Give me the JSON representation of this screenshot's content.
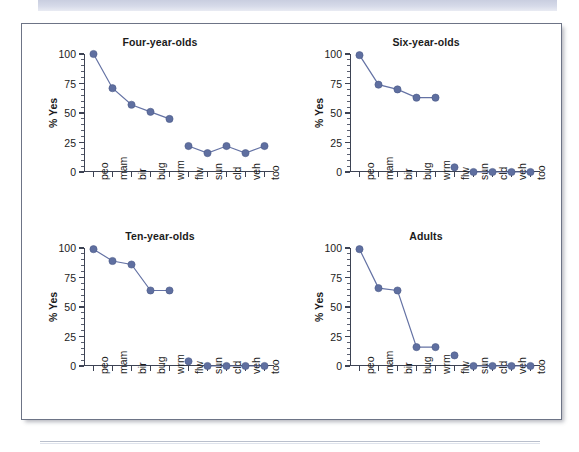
{
  "figure": {
    "panels_per_row": 2,
    "marker_color": "#5f6fa0",
    "line_color": "#6472a4",
    "axis_color": "#3d4354",
    "frame_border_color": "#6d7486",
    "banner_color": "#d1d6e4",
    "background": "#ffffff"
  },
  "chart_data": [
    {
      "type": "line",
      "title": "Four-year-olds",
      "xlabel": "",
      "ylabel": "% Yes",
      "ylim": [
        0,
        100
      ],
      "yticks": [
        0,
        25,
        50,
        75,
        100
      ],
      "ytick_labels": [
        "0",
        "25",
        "50",
        "75",
        "100"
      ],
      "grid": false,
      "legend": "none",
      "categories": [
        "peo",
        "mam",
        "bir",
        "bug",
        "wrm",
        "flw",
        "sun",
        "cld",
        "veh",
        "too"
      ],
      "values": [
        100,
        71,
        57,
        51,
        45,
        22,
        16,
        22,
        16,
        22
      ],
      "segments": [
        [
          0,
          1,
          2,
          3,
          4
        ],
        [
          5,
          6,
          7,
          8,
          9
        ]
      ]
    },
    {
      "type": "line",
      "title": "Six-year-olds",
      "xlabel": "",
      "ylabel": "% Yes",
      "ylim": [
        0,
        100
      ],
      "yticks": [
        0,
        25,
        50,
        75,
        100
      ],
      "ytick_labels": [
        "0",
        "25",
        "50",
        "75",
        "100"
      ],
      "grid": false,
      "legend": "none",
      "categories": [
        "peo",
        "mam",
        "bir",
        "bug",
        "wrm",
        "flw",
        "sun",
        "cld",
        "veh",
        "too"
      ],
      "values": [
        99,
        74,
        70,
        63,
        63,
        4,
        0,
        0,
        0,
        0
      ],
      "segments": [
        [
          0,
          1,
          2,
          3,
          4
        ],
        [
          5
        ],
        [
          6,
          7,
          8,
          9
        ]
      ]
    },
    {
      "type": "line",
      "title": "Ten-year-olds",
      "xlabel": "",
      "ylabel": "% Yes",
      "ylim": [
        0,
        100
      ],
      "yticks": [
        0,
        25,
        50,
        75,
        100
      ],
      "ytick_labels": [
        "0",
        "25",
        "50",
        "75",
        "100"
      ],
      "grid": false,
      "legend": "none",
      "categories": [
        "peo",
        "mam",
        "bir",
        "bug",
        "wrm",
        "flw",
        "sun",
        "cld",
        "veh",
        "too"
      ],
      "values": [
        99,
        89,
        86,
        64,
        64,
        4,
        0,
        0,
        0,
        0
      ],
      "segments": [
        [
          0,
          1,
          2,
          3,
          4
        ],
        [
          5
        ],
        [
          6,
          7,
          8,
          9
        ]
      ]
    },
    {
      "type": "line",
      "title": "Adults",
      "xlabel": "",
      "ylabel": "% Yes",
      "ylim": [
        0,
        100
      ],
      "yticks": [
        0,
        25,
        50,
        75,
        100
      ],
      "ytick_labels": [
        "0",
        "25",
        "50",
        "75",
        "100"
      ],
      "grid": false,
      "legend": "none",
      "categories": [
        "peo",
        "mam",
        "bir",
        "bug",
        "wrm",
        "flw",
        "sun",
        "cld",
        "veh",
        "too"
      ],
      "values": [
        99,
        66,
        64,
        16,
        16,
        9,
        0,
        0,
        0,
        0
      ],
      "segments": [
        [
          0,
          1,
          2,
          3,
          4
        ],
        [
          5
        ],
        [
          6,
          7,
          8,
          9
        ]
      ]
    }
  ]
}
